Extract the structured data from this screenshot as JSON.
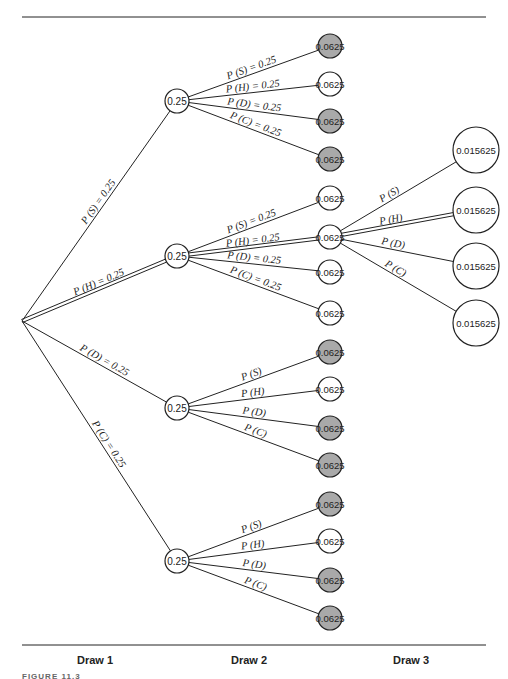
{
  "diagram": {
    "type": "probability-tree",
    "colors": {
      "line": "#222222",
      "node_fill": "#ffffff",
      "node_fill_shaded": "#a9a9a9"
    },
    "root": {
      "x": 22,
      "y": 321
    },
    "level1": [
      {
        "id": "S",
        "x": 177,
        "y": 101,
        "value": "0.25",
        "edge_label": "P (S) = 0.25",
        "double_edge": false
      },
      {
        "id": "H",
        "x": 177,
        "y": 256,
        "value": "0.25",
        "edge_label": "P (H) = 0.25",
        "double_edge": true
      },
      {
        "id": "D",
        "x": 177,
        "y": 408,
        "value": "0.25",
        "edge_label": "P (D) = 0.25",
        "double_edge": false
      },
      {
        "id": "C",
        "x": 177,
        "y": 561,
        "value": "0.25",
        "edge_label": "P (C) = 0.25",
        "double_edge": false
      }
    ],
    "level2": [
      {
        "parent": 0,
        "x": 330,
        "y": 46,
        "value": "0.0625",
        "shaded": true,
        "edge_label": "P (S) = 0.25",
        "double_edge": false
      },
      {
        "parent": 0,
        "x": 330,
        "y": 84,
        "value": "0.0625",
        "shaded": false,
        "edge_label": "P (H) = 0.25",
        "double_edge": false
      },
      {
        "parent": 0,
        "x": 330,
        "y": 121,
        "value": "0.0625",
        "shaded": true,
        "edge_label": "P (D) = 0.25",
        "double_edge": false
      },
      {
        "parent": 0,
        "x": 330,
        "y": 159,
        "value": "0.0625",
        "shaded": true,
        "edge_label": "P (C) = 0.25",
        "double_edge": false
      },
      {
        "parent": 1,
        "x": 330,
        "y": 198,
        "value": "0.0625",
        "shaded": false,
        "edge_label": "P (S) = 0.25",
        "double_edge": false
      },
      {
        "parent": 1,
        "x": 330,
        "y": 237,
        "value": "0.0625",
        "shaded": false,
        "edge_label": "P (H) = 0.25",
        "double_edge": true
      },
      {
        "parent": 1,
        "x": 330,
        "y": 272,
        "value": "0.0625",
        "shaded": false,
        "edge_label": "P (D) = 0.25",
        "double_edge": false
      },
      {
        "parent": 1,
        "x": 330,
        "y": 313,
        "value": "0.0625",
        "shaded": false,
        "edge_label": "P (C) = 0.25",
        "double_edge": false
      },
      {
        "parent": 2,
        "x": 330,
        "y": 352,
        "value": "0.0625",
        "shaded": true,
        "edge_label": "P (S)",
        "double_edge": false
      },
      {
        "parent": 2,
        "x": 330,
        "y": 389,
        "value": "0.0625",
        "shaded": false,
        "edge_label": "P (H)",
        "double_edge": false
      },
      {
        "parent": 2,
        "x": 330,
        "y": 428,
        "value": "0.0625",
        "shaded": true,
        "edge_label": "P (D)",
        "double_edge": false
      },
      {
        "parent": 2,
        "x": 330,
        "y": 465,
        "value": "0.0625",
        "shaded": true,
        "edge_label": "P (C)",
        "double_edge": false
      },
      {
        "parent": 3,
        "x": 330,
        "y": 504,
        "value": "0.0625",
        "shaded": true,
        "edge_label": "P (S)",
        "double_edge": false
      },
      {
        "parent": 3,
        "x": 330,
        "y": 541,
        "value": "0.0625",
        "shaded": false,
        "edge_label": "P (H)",
        "double_edge": false
      },
      {
        "parent": 3,
        "x": 330,
        "y": 580,
        "value": "0.0625",
        "shaded": true,
        "edge_label": "P (D)",
        "double_edge": false
      },
      {
        "parent": 3,
        "x": 330,
        "y": 618,
        "value": "0.0625",
        "shaded": true,
        "edge_label": "P (C)",
        "double_edge": false
      }
    ],
    "level3": [
      {
        "parent": 5,
        "x": 476,
        "y": 150,
        "value": "0.015625",
        "edge_label": "P (S)",
        "double_edge": false
      },
      {
        "parent": 5,
        "x": 476,
        "y": 210,
        "value": "0.015625",
        "edge_label": "P (H)",
        "double_edge": true
      },
      {
        "parent": 5,
        "x": 476,
        "y": 266,
        "value": "0.015625",
        "edge_label": "P (D)",
        "double_edge": false
      },
      {
        "parent": 5,
        "x": 476,
        "y": 323,
        "value": "0.015625",
        "edge_label": "P (C)",
        "double_edge": false
      }
    ]
  },
  "axis": {
    "labels": [
      {
        "text": "Draw 1",
        "x": 95
      },
      {
        "text": "Draw 2",
        "x": 249
      },
      {
        "text": "Draw 3",
        "x": 411
      }
    ]
  },
  "caption": "FIGURE 11.3"
}
